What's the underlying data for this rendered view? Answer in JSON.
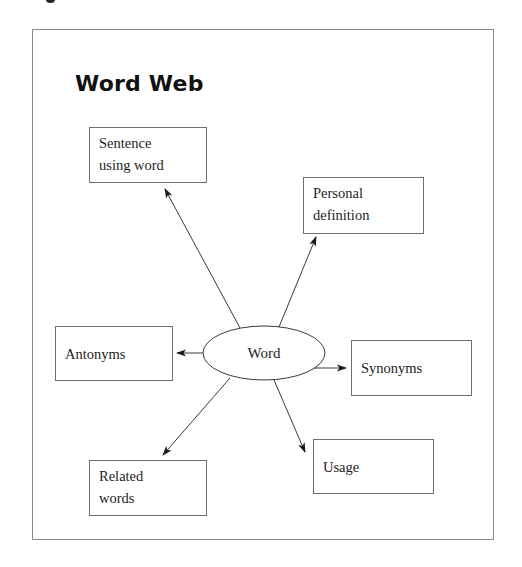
{
  "diagram": {
    "title": "Word Web",
    "center": {
      "label": "Word",
      "shape": "ellipse",
      "cx": 264,
      "cy": 353,
      "rx": 61,
      "ry": 27
    },
    "nodes": [
      {
        "id": "sentence",
        "label": "Sentence\nusing word",
        "x": 89,
        "y": 127,
        "w": 118,
        "h": 56
      },
      {
        "id": "personal",
        "label": "Personal\ndefinition",
        "x": 303,
        "y": 177,
        "w": 121,
        "h": 57
      },
      {
        "id": "antonyms",
        "label": "Antonyms",
        "x": 55,
        "y": 326,
        "w": 118,
        "h": 55
      },
      {
        "id": "synonyms",
        "label": "Synonyms",
        "x": 351,
        "y": 340,
        "w": 121,
        "h": 56
      },
      {
        "id": "related",
        "label": "Related\nwords",
        "x": 89,
        "y": 460,
        "w": 118,
        "h": 56
      },
      {
        "id": "usage",
        "label": "Usage",
        "x": 313,
        "y": 439,
        "w": 121,
        "h": 55
      }
    ],
    "edges": [
      {
        "from": "word",
        "to": "sentence",
        "x1": 240,
        "y1": 328,
        "x2": 165,
        "y2": 189
      },
      {
        "from": "word",
        "to": "personal",
        "x1": 279,
        "y1": 327,
        "x2": 316,
        "y2": 237
      },
      {
        "from": "word",
        "to": "antonyms",
        "x1": 203,
        "y1": 353,
        "x2": 177,
        "y2": 353
      },
      {
        "from": "word",
        "to": "synonyms",
        "x1": 314,
        "y1": 368,
        "x2": 346,
        "y2": 368
      },
      {
        "from": "word",
        "to": "related",
        "x1": 230,
        "y1": 378,
        "x2": 163,
        "y2": 455
      },
      {
        "from": "word",
        "to": "usage",
        "x1": 274,
        "y1": 380,
        "x2": 305,
        "y2": 452
      }
    ],
    "colors": {
      "line": "#3a3a3a",
      "box_border": "#6e6e6e",
      "frame_border": "#8a8a8a",
      "text": "#1e1e1e"
    }
  }
}
